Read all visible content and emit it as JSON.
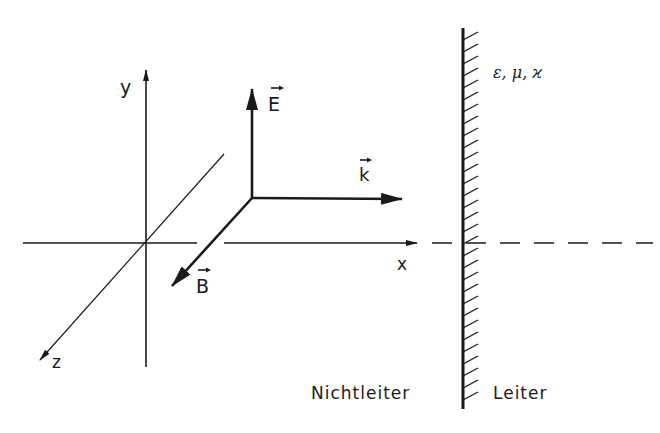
{
  "diagram": {
    "colors": {
      "ink": "#1a1a1a",
      "background": "#ffffff"
    },
    "axes": {
      "x_label": "x",
      "y_label": "y",
      "z_label": "z"
    },
    "vectors": {
      "E_label": "E",
      "k_label": "k",
      "B_label": "B",
      "vector_arrow_mark": "→"
    },
    "boundary": {
      "material_params": "ε, μ, ϰ",
      "left_region": "Nichtleiter",
      "right_region": "Leiter"
    }
  }
}
